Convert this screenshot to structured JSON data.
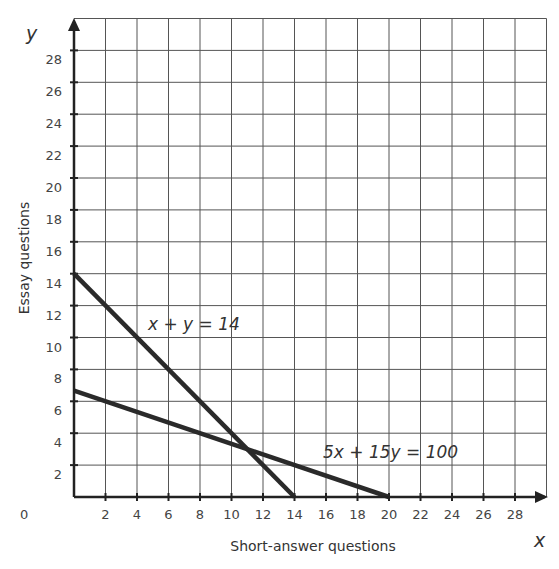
{
  "chart_data": {
    "type": "line",
    "title": "",
    "xlabel": "Short-answer questions",
    "ylabel": "Essay questions",
    "x_axis_var": "x",
    "y_axis_var": "y",
    "xlim": [
      0,
      30
    ],
    "ylim": [
      0,
      30
    ],
    "grid": true,
    "x_ticks": [
      0,
      2,
      4,
      6,
      8,
      10,
      12,
      14,
      16,
      18,
      20,
      22,
      24,
      26,
      28
    ],
    "y_ticks": [
      2,
      4,
      6,
      8,
      10,
      12,
      14,
      16,
      18,
      20,
      22,
      24,
      26,
      28
    ],
    "series": [
      {
        "name": "x + y = 14",
        "points": [
          [
            0,
            14
          ],
          [
            14,
            0
          ]
        ]
      },
      {
        "name": "5x + 15y = 100",
        "points": [
          [
            0,
            6.67
          ],
          [
            20,
            0
          ]
        ]
      }
    ],
    "annotations": [
      {
        "text": "x + y = 14",
        "x": 4.7,
        "y": 10.6
      },
      {
        "text": "5x + 15y = 100",
        "x": 15.6,
        "y": 2.5
      }
    ]
  },
  "labels": {
    "xlabel": "Short-answer questions",
    "ylabel": "Essay questions",
    "x_var": "x",
    "y_var": "y",
    "origin": "0",
    "eq1": "x + y = 14",
    "eq2": "5x + 15y = 100"
  }
}
